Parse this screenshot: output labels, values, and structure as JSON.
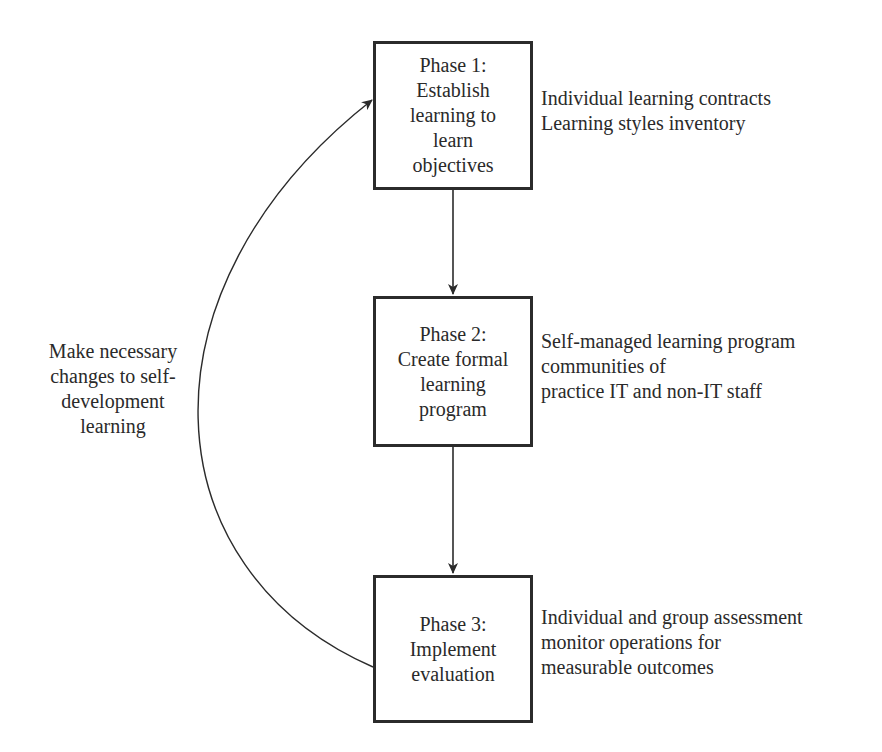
{
  "diagram": {
    "phases": [
      {
        "id": "phase-1",
        "lines": [
          "Phase 1:",
          "Establish",
          "learning to",
          "learn",
          "objectives"
        ],
        "notes": [
          "Individual learning contracts",
          "Learning styles inventory"
        ]
      },
      {
        "id": "phase-2",
        "lines": [
          "Phase 2:",
          "Create formal",
          "learning",
          "program"
        ],
        "notes": [
          "Self-managed learning program",
          "communities of",
          "practice IT and non-IT staff"
        ]
      },
      {
        "id": "phase-3",
        "lines": [
          "Phase 3:",
          "Implement",
          "evaluation"
        ],
        "notes": [
          "Individual and group assessment",
          "monitor operations for",
          "measurable outcomes"
        ]
      }
    ],
    "feedback_label": [
      "Make necessary",
      "changes to self-",
      "development",
      "learning"
    ],
    "edges": [
      {
        "from": "phase-1",
        "to": "phase-2",
        "type": "straight-arrow"
      },
      {
        "from": "phase-2",
        "to": "phase-3",
        "type": "straight-arrow"
      },
      {
        "from": "phase-3",
        "to": "phase-1",
        "type": "curved-arrow",
        "label": "Make necessary changes to self-development learning"
      }
    ],
    "colors": {
      "stroke": "#2b2b2b",
      "text": "#2a2a2a",
      "background": "#ffffff"
    }
  }
}
